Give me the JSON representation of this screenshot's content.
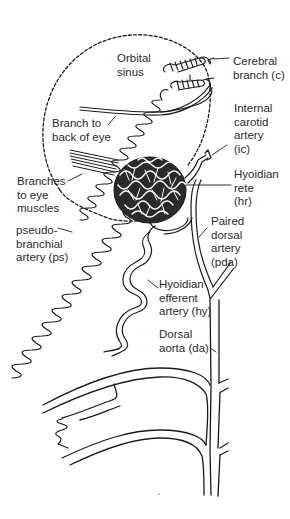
{
  "diagram": {
    "line_color": "#1a1a1a",
    "background": "#ffffff",
    "labels": [
      {
        "id": "orbital-sinus",
        "text": "Orbital\nsinus",
        "x": 117,
        "y": 52
      },
      {
        "id": "cerebral-branch",
        "text": "Cerebral\nbranch (c)",
        "x": 233,
        "y": 55
      },
      {
        "id": "branch-to-back-of-eye",
        "text": "Branch to\nback of eye",
        "x": 52,
        "y": 117
      },
      {
        "id": "internal-carotid-artery",
        "text": "Internal\ncarotid\nartery\n(ic)",
        "x": 234,
        "y": 102
      },
      {
        "id": "branches-to-eye-muscles",
        "text": "Branches\nto eye\nmuscles",
        "x": 17,
        "y": 175
      },
      {
        "id": "hyoidian-rete",
        "text": "Hyoidian\nrete\n(hr)",
        "x": 234,
        "y": 168
      },
      {
        "id": "pseudobranchial-artery",
        "text": "pseudo-\nbranchial\nartery (ps)",
        "x": 16,
        "y": 224
      },
      {
        "id": "paired-dorsal-artery",
        "text": "Paired\ndorsal\nartery\n(pda)",
        "x": 211,
        "y": 215
      },
      {
        "id": "hyoidian-efferent-artery",
        "text": "Hyoidian\nefferent\nartery (hy)",
        "x": 159,
        "y": 278
      },
      {
        "id": "dorsal-aorta",
        "text": "Dorsal\naorta (da)",
        "x": 159,
        "y": 328
      }
    ]
  }
}
